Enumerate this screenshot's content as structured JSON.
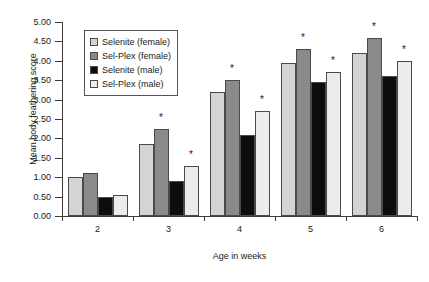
{
  "chart_data": {
    "type": "bar",
    "title": "",
    "xlabel": "Age in weeks",
    "ylabel": "Mean body feathering score",
    "categories": [
      "2",
      "3",
      "4",
      "5",
      "6"
    ],
    "ylim": [
      0.0,
      5.0
    ],
    "ytick_step": 0.5,
    "ytick_labels": [
      "0.00",
      "0.50",
      "1.00",
      "1.50",
      "2.00",
      "2.50",
      "3.00",
      "3.50",
      "4.00",
      "4.50",
      "5.00"
    ],
    "grid": false,
    "legend_position": "upper-left-inside",
    "series": [
      {
        "name": "Selenite (female)",
        "color": "#d4d4d4",
        "values": [
          1.0,
          1.85,
          3.2,
          3.95,
          4.2
        ],
        "significance": [
          "",
          "",
          "",
          "",
          ""
        ]
      },
      {
        "name": "Sel-Plex (female)",
        "color": "#8a8a8a",
        "values": [
          1.1,
          2.25,
          3.5,
          4.3,
          4.6
        ],
        "significance": [
          "",
          "*",
          "*",
          "*",
          "*"
        ]
      },
      {
        "name": "Selenite (male)",
        "color": "#0d0d0d",
        "values": [
          0.5,
          0.9,
          2.1,
          3.45,
          3.6
        ],
        "significance": [
          "",
          "",
          "",
          "",
          ""
        ]
      },
      {
        "name": "Sel-Plex (male)",
        "color": "#ececec",
        "values": [
          0.55,
          1.3,
          2.7,
          3.7,
          4.0
        ],
        "significance": [
          "",
          "*",
          "*",
          "*",
          "*"
        ]
      }
    ],
    "annotation_symbol": "*"
  }
}
